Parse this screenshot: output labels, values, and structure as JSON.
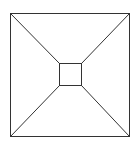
{
  "diagram": {
    "type": "square-frustum-top-view",
    "stroke_color": "#333333",
    "background": "#ffffff",
    "outer_square": {
      "x1": 10,
      "y1": 13,
      "x2": 129,
      "y2": 136
    },
    "inner_square": {
      "x1": 59,
      "y1": 63,
      "x2": 81,
      "y2": 85
    },
    "connectors": 4
  }
}
